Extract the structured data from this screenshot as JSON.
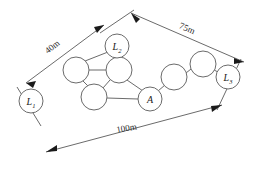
{
  "diagram": {
    "background_color": "#ffffff",
    "stroke_color": "#6b6b6b",
    "label_color": "#1a1a1a",
    "anchors": [
      {
        "id": "L1",
        "label_main": "L",
        "label_sub": "1",
        "cx": 31,
        "cy": 101,
        "r": 12
      },
      {
        "id": "L2",
        "label_main": "L",
        "label_sub": "2",
        "cx": 117,
        "cy": 46,
        "r": 12
      },
      {
        "id": "L3",
        "label_main": "L",
        "label_sub": "3",
        "cx": 228,
        "cy": 77,
        "r": 12
      }
    ],
    "target_node": {
      "id": "A",
      "label_main": "A",
      "label_sub": "",
      "cx": 150,
      "cy": 99,
      "r": 12
    },
    "plain_nodes": [
      {
        "id": "n1",
        "cx": 76,
        "cy": 70,
        "r": 13
      },
      {
        "id": "n2",
        "cx": 119,
        "cy": 70,
        "r": 13
      },
      {
        "id": "n3",
        "cx": 94,
        "cy": 97,
        "r": 13
      },
      {
        "id": "n4",
        "cx": 174,
        "cy": 77,
        "r": 13
      },
      {
        "id": "n5",
        "cx": 203,
        "cy": 64,
        "r": 13
      }
    ],
    "edges": [
      {
        "from": "n1",
        "to": "n2"
      },
      {
        "from": "n1",
        "to": "n3"
      },
      {
        "from": "n2",
        "to": "n3"
      },
      {
        "from": "n2",
        "to": "L2"
      },
      {
        "from": "n1",
        "to": "L2"
      },
      {
        "from": "n2",
        "to": "A"
      },
      {
        "from": "n3",
        "to": "A"
      },
      {
        "from": "A",
        "to": "n4"
      },
      {
        "from": "n4",
        "to": "n5"
      },
      {
        "from": "n5",
        "to": "L3"
      }
    ],
    "dimensions": [
      {
        "id": "d-40m",
        "label": "40m",
        "from": "L1",
        "to": "L2",
        "label_x": 54,
        "label_y": 49,
        "label_rotation": -38
      },
      {
        "id": "d-75m",
        "label": "75m",
        "from": "L2",
        "to": "L3",
        "label_x": 186,
        "label_y": 31,
        "label_rotation": 23
      },
      {
        "id": "d-100m",
        "label": "100m",
        "from": "L1",
        "to": "L3",
        "label_x": 127,
        "label_y": 131,
        "label_rotation": -10
      }
    ]
  }
}
